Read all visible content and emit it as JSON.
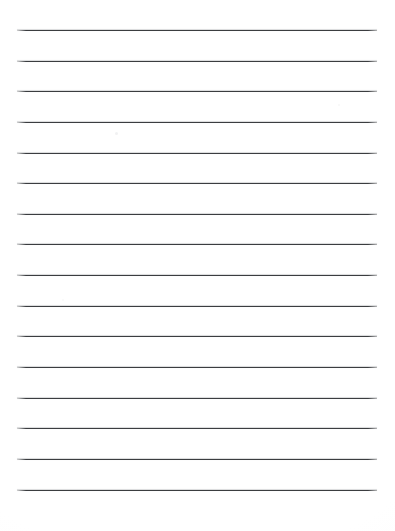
{
  "document": {
    "kind": "lined-paper-scan",
    "title": "Blank lined paper",
    "page_width": 395,
    "page_height": 531,
    "background_color": "#ffffff",
    "has_text": false,
    "has_margin_rule": false,
    "has_header": false,
    "has_page_number": false,
    "visible_text": ""
  },
  "ruling": {
    "line_count": 16,
    "line_color": "#3b3d40",
    "line_thickness_px": 1,
    "line_left_px": 17,
    "line_right_px": 377,
    "line_length_px": 360,
    "first_line_y_px": 30,
    "last_line_y_px": 490,
    "line_spacing_px": 30.6,
    "lines": [
      {
        "index": 1,
        "y": 30,
        "x1": 17,
        "x2": 377
      },
      {
        "index": 2,
        "y": 61,
        "x1": 17,
        "x2": 377
      },
      {
        "index": 3,
        "y": 91,
        "x1": 17,
        "x2": 377
      },
      {
        "index": 4,
        "y": 122,
        "x1": 17,
        "x2": 377
      },
      {
        "index": 5,
        "y": 153,
        "x1": 17,
        "x2": 377
      },
      {
        "index": 6,
        "y": 183,
        "x1": 17,
        "x2": 377
      },
      {
        "index": 7,
        "y": 214,
        "x1": 17,
        "x2": 377
      },
      {
        "index": 8,
        "y": 244,
        "x1": 17,
        "x2": 377
      },
      {
        "index": 9,
        "y": 275,
        "x1": 17,
        "x2": 377
      },
      {
        "index": 10,
        "y": 306,
        "x1": 17,
        "x2": 377
      },
      {
        "index": 11,
        "y": 336,
        "x1": 17,
        "x2": 377
      },
      {
        "index": 12,
        "y": 367,
        "x1": 17,
        "x2": 377
      },
      {
        "index": 13,
        "y": 398,
        "x1": 17,
        "x2": 377
      },
      {
        "index": 14,
        "y": 428,
        "x1": 17,
        "x2": 377
      },
      {
        "index": 15,
        "y": 459,
        "x1": 17,
        "x2": 377
      },
      {
        "index": 16,
        "y": 490,
        "x1": 17,
        "x2": 377
      }
    ]
  },
  "artifacts": {
    "specks": [
      {
        "x": 115,
        "y": 132,
        "size": 3,
        "opacity": 0.4
      },
      {
        "x": 338,
        "y": 104,
        "size": 2,
        "opacity": 0.26
      },
      {
        "x": 62,
        "y": 299,
        "size": 2,
        "opacity": 0.22
      }
    ]
  }
}
